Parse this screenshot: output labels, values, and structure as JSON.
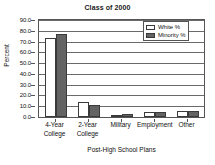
{
  "chart_data": {
    "type": "bar",
    "title": "Class of 2000",
    "xlabel": "Post-High School Plans",
    "ylabel": "Percent",
    "categories": [
      "4-Year\nCollege",
      "2-Year\nCollege",
      "Military",
      "Employment",
      "Other"
    ],
    "series": [
      {
        "name": "White %",
        "color": "#ffffff",
        "values": [
          73.5,
          14.0,
          2.0,
          5.0,
          6.0
        ]
      },
      {
        "name": "Minority %",
        "color": "#636363",
        "values": [
          77.0,
          11.0,
          2.5,
          5.0,
          5.5
        ]
      }
    ],
    "ylim": [
      0,
      90
    ],
    "yticks": [
      "0.0",
      "10.0",
      "20.0",
      "30.0",
      "40.0",
      "50.0",
      "60.0",
      "70.0",
      "80.0",
      "90.0"
    ],
    "ytick_values": [
      0,
      10,
      20,
      30,
      40,
      50,
      60,
      70,
      80,
      90
    ],
    "grid": true,
    "legend_position": "top-right"
  },
  "legend": {
    "entries": [
      {
        "label": "White %"
      },
      {
        "label": "Minority %"
      }
    ]
  },
  "colors": {
    "white_series": "#ffffff",
    "minority_series": "#636363",
    "axis": "#555555",
    "grid": "#6a6a6a",
    "text": "#111111"
  }
}
